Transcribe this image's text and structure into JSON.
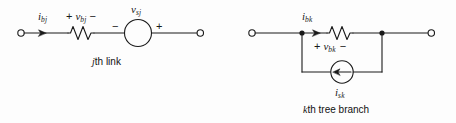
{
  "figure": {
    "background_color": "#fdfdfd",
    "stroke_color": "#1a1a1a",
    "text_color": "#1a1a1a"
  },
  "link_circuit": {
    "caption_prefix": "j",
    "caption_text": "th link",
    "current_label": {
      "symbol": "i",
      "subscript": "bj"
    },
    "resistor_voltage": {
      "plus": "+",
      "symbol": "v",
      "subscript": "bj",
      "minus": "−"
    },
    "source_label": {
      "symbol": "v",
      "subscript": "sj"
    },
    "source_polarity_left": "−",
    "source_polarity_right": "+",
    "element_names": {
      "resistor": "resistor",
      "source": "voltage-source",
      "left_terminal": "left-terminal",
      "right_terminal": "right-terminal"
    }
  },
  "branch_circuit": {
    "caption_prefix": "k",
    "caption_text": "th tree branch",
    "current_label": {
      "symbol": "i",
      "subscript": "bk"
    },
    "resistor_voltage": {
      "plus": "+",
      "symbol": "v",
      "subscript": "bk",
      "minus": "−"
    },
    "source_label": {
      "symbol": "i",
      "subscript": "sk"
    },
    "element_names": {
      "resistor": "resistor",
      "source": "current-source",
      "left_terminal": "left-terminal",
      "right_terminal": "right-terminal",
      "left_node": "left-node-dot",
      "right_node": "right-node-dot"
    }
  }
}
